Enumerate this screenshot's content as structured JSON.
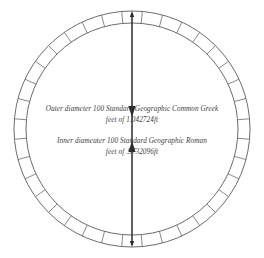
{
  "diagram": {
    "background_color": "#ffffff",
    "ring": {
      "name": "segmented-annulus",
      "segment_count": 36,
      "outer_radius_px": 118,
      "inner_radius_px": 106,
      "center_x_px": 132,
      "center_y_px": 129,
      "stroke_color": "#5a5a5a"
    },
    "dimension": {
      "name": "vertical-diameter-arrow",
      "orientation": "vertical",
      "arrowheads": "both-ends",
      "color": "#2b2b2b",
      "top_y_px": 11,
      "bottom_y_px": 247,
      "x_px": 132
    },
    "annotations": [
      {
        "id": "outer-diameter-note",
        "line1": "Outer diameter 100 Standard Geographic Common Greek",
        "line2": "feet of 1.042724ft"
      },
      {
        "id": "inner-diameter-note",
        "line1": "Inner diameater 100 Standard Geographic Roman",
        "line2": "feet of .9732096ft"
      }
    ]
  }
}
